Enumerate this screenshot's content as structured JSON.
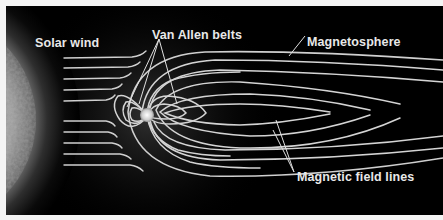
{
  "diagram": {
    "type": "labeled-illustration",
    "background_color": "#000000",
    "line_color": "#d8d8d8",
    "labels": {
      "solar_wind": "Solar wind",
      "van_allen_belts": "Van Allen belts",
      "magnetosphere": "Magnetosphere",
      "magnetic_field_lines": "Magnetic field lines"
    },
    "elements": [
      "sun",
      "solar-wind-streams",
      "earth",
      "van-allen-belts",
      "magnetosphere-boundary",
      "magnetic-field-lines"
    ]
  }
}
